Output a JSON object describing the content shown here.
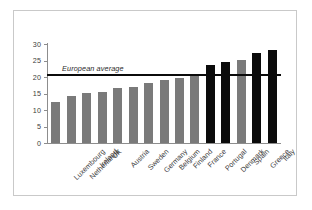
{
  "chart_data": {
    "type": "bar",
    "title": "",
    "xlabel": "",
    "ylabel": "",
    "ylim": [
      0,
      30
    ],
    "yticks": [
      "0",
      "5",
      "10",
      "15",
      "20",
      "25",
      "30"
    ],
    "grid": false,
    "legend": "none",
    "categories": [
      "Luxembourg",
      "Netherlands",
      "Ireland",
      "UK",
      "Austria",
      "Sweden",
      "Germany",
      "Belgium",
      "Finland",
      "France",
      "Portugal",
      "Denmark",
      "Spain",
      "Greece",
      "Italy"
    ],
    "values": [
      12.5,
      14.2,
      15.3,
      15.6,
      16.6,
      17.0,
      18.3,
      19.0,
      19.8,
      20.8,
      23.7,
      24.6,
      25.2,
      27.3,
      28.2
    ],
    "bar_colors": [
      "#7a7a7a",
      "#7a7a7a",
      "#7a7a7a",
      "#7a7a7a",
      "#7a7a7a",
      "#7a7a7a",
      "#7a7a7a",
      "#7a7a7a",
      "#7a7a7a",
      "#7a7a7a",
      "#0b0b0b",
      "#0b0b0b",
      "#7a7a7a",
      "#0b0b0b",
      "#0b0b0b"
    ],
    "annotations": [
      {
        "name": "european-average",
        "label": "European average",
        "value": 20.7,
        "style": "horizontal-line",
        "color": "#0b0b0b"
      }
    ]
  }
}
